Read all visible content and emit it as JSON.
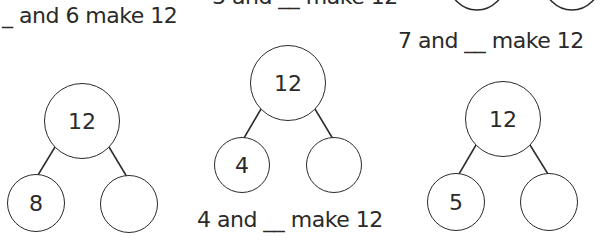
{
  "prompts": {
    "top_left": "_ and 6 make 12",
    "top_middle": "3 and __ make 12",
    "right": "7 and __ make 12",
    "middle": "4 and __ make 12"
  },
  "trees": [
    {
      "whole": "12",
      "part_left": "8",
      "part_right": ""
    },
    {
      "whole": "12",
      "part_left": "4",
      "part_right": ""
    },
    {
      "whole": "12",
      "part_left": "5",
      "part_right": ""
    }
  ],
  "colors": {
    "ink": "#2a2a2a",
    "background": "#ffffff"
  }
}
